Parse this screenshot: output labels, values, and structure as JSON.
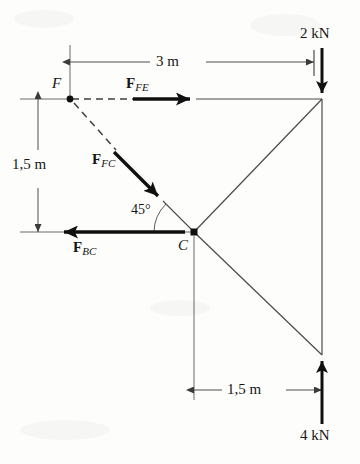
{
  "figure": {
    "type": "free-body-diagram"
  },
  "nodes": [
    {
      "id": "F",
      "label": "F",
      "x": 70,
      "y": 99
    },
    {
      "id": "C",
      "label": "C",
      "x": 194,
      "y": 232
    },
    {
      "id": "E",
      "label": "",
      "x": 322,
      "y": 99
    },
    {
      "id": "D",
      "label": "",
      "x": 322,
      "y": 355
    }
  ],
  "dimensions": [
    {
      "name": "top-span",
      "text": "3 m",
      "orientation": "horizontal",
      "from_x": 70,
      "to_x": 314,
      "y": 62
    },
    {
      "name": "left-height",
      "text": "1,5 m",
      "orientation": "vertical",
      "x": 38,
      "from_y": 99,
      "to_y": 232
    },
    {
      "name": "bottom-span",
      "text": "1,5 m",
      "orientation": "horizontal",
      "from_x": 194,
      "to_x": 322,
      "y": 390
    }
  ],
  "loads": [
    {
      "name": "top-load",
      "text": "2 kN",
      "direction": "down",
      "x": 322,
      "from_y": 48,
      "to_y": 99
    },
    {
      "name": "bottom-load",
      "text": "4 kN",
      "direction": "up",
      "x": 322,
      "from_y": 424,
      "to_y": 355
    }
  ],
  "forces": [
    {
      "name": "F_FE",
      "symbol": "F",
      "subscript": "FE",
      "direction": "right",
      "label_x": 126,
      "label_y": 76,
      "from_x": 133,
      "from_y": 99,
      "to_x": 196,
      "to_y": 99
    },
    {
      "name": "F_FC",
      "symbol": "F",
      "subscript": "FC",
      "direction": "down-right-45",
      "label_x": 92,
      "label_y": 152,
      "from_x": 114,
      "from_y": 152,
      "to_x": 163,
      "to_y": 201
    },
    {
      "name": "F_BC",
      "symbol": "F",
      "subscript": "BC",
      "direction": "left",
      "label_x": 73,
      "label_y": 240,
      "from_x": 185,
      "from_y": 232,
      "to_x": 58,
      "to_y": 232
    }
  ],
  "angles": [
    {
      "name": "angle-at-C",
      "text": "45°",
      "x": 131,
      "y": 203,
      "vertex_x": 194,
      "vertex_y": 232,
      "value": 45
    }
  ],
  "members": [
    {
      "name": "member-F-E",
      "style": "dashed-then-solid",
      "from": "F",
      "to": "E"
    },
    {
      "name": "member-F-C",
      "style": "dashed",
      "from": "F",
      "to": "C"
    },
    {
      "name": "member-C-E",
      "style": "solid",
      "from": "C",
      "to": "E"
    },
    {
      "name": "member-C-D",
      "style": "solid",
      "from": "C",
      "to": "D"
    },
    {
      "name": "member-E-D",
      "style": "solid",
      "from": "E",
      "to": "D"
    }
  ],
  "colors": {
    "ink": "#161616",
    "thin_line": "#4a4a4a",
    "paper": "#fdfdfb"
  }
}
